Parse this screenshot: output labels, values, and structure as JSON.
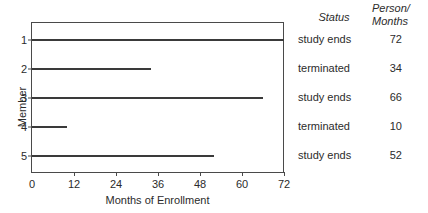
{
  "chart_data": {
    "type": "bar",
    "orientation": "horizontal",
    "title": "",
    "xlabel": "Months of Enrollment",
    "ylabel": "Member",
    "xlim": [
      0,
      72
    ],
    "ylim": [
      0.4,
      5.6
    ],
    "grid": false,
    "legend": null,
    "xticks": [
      "0",
      "12",
      "24",
      "36",
      "48",
      "60",
      "72"
    ],
    "xtick_values": [
      0,
      12,
      24,
      36,
      48,
      60,
      72
    ],
    "yticks": [
      "1",
      "2",
      "3",
      "4",
      "5"
    ],
    "ytick_values": [
      1,
      2,
      3,
      4,
      5
    ],
    "categories": [
      "1",
      "2",
      "3",
      "4",
      "5"
    ],
    "values": [
      72,
      34,
      66,
      10,
      52
    ],
    "series": [
      {
        "name": "Months of Enrollment",
        "values": [
          72,
          34,
          66,
          10,
          52
        ]
      }
    ],
    "points": [
      {
        "member": "1",
        "months": 72,
        "status": "study ends",
        "person_months": "72"
      },
      {
        "member": "2",
        "months": 34,
        "status": "terminated",
        "person_months": "34"
      },
      {
        "member": "3",
        "months": 66,
        "status": "study ends",
        "person_months": "66"
      },
      {
        "member": "4",
        "months": 10,
        "status": "terminated",
        "person_months": "10"
      },
      {
        "member": "5",
        "months": 52,
        "status": "study ends",
        "person_months": "52"
      }
    ],
    "annotation_columns": {
      "status_header": "Status",
      "person_months_header_line1": "Person/",
      "person_months_header_line2": "Months"
    }
  },
  "axes": {
    "x_label": "Months of Enrollment",
    "y_label": "Member",
    "x_ticks": [
      "0",
      "12",
      "24",
      "36",
      "48",
      "60",
      "72"
    ],
    "y_ticks": [
      "1",
      "2",
      "3",
      "4",
      "5"
    ]
  },
  "columns": {
    "status_header": "Status",
    "person_months_header_line1": "Person/",
    "person_months_header_line2": "Months",
    "status_values": [
      "study ends",
      "terminated",
      "study ends",
      "terminated",
      "study ends"
    ],
    "person_months_values": [
      "72",
      "34",
      "66",
      "10",
      "52"
    ]
  },
  "colors": {
    "line": "#3a3a3a",
    "axis": "#4a4a4a",
    "text": "#2b2b2b",
    "background": "#ffffff"
  }
}
